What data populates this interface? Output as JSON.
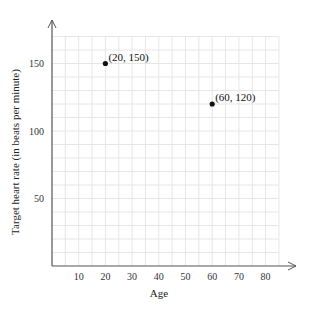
{
  "chart_data": {
    "type": "scatter",
    "title": "",
    "xlabel": "Age",
    "ylabel": "Target heart rate (in beats per minute)",
    "xlim": [
      0,
      85
    ],
    "ylim": [
      0,
      170
    ],
    "grid": true,
    "x_ticks": [
      "10",
      "20",
      "30",
      "40",
      "50",
      "60",
      "70",
      "80"
    ],
    "y_ticks": [
      "50",
      "100",
      "150"
    ],
    "points": [
      {
        "x": 20,
        "y": 150,
        "label": "(20, 150)"
      },
      {
        "x": 60,
        "y": 120,
        "label": "(60, 120)"
      }
    ]
  }
}
